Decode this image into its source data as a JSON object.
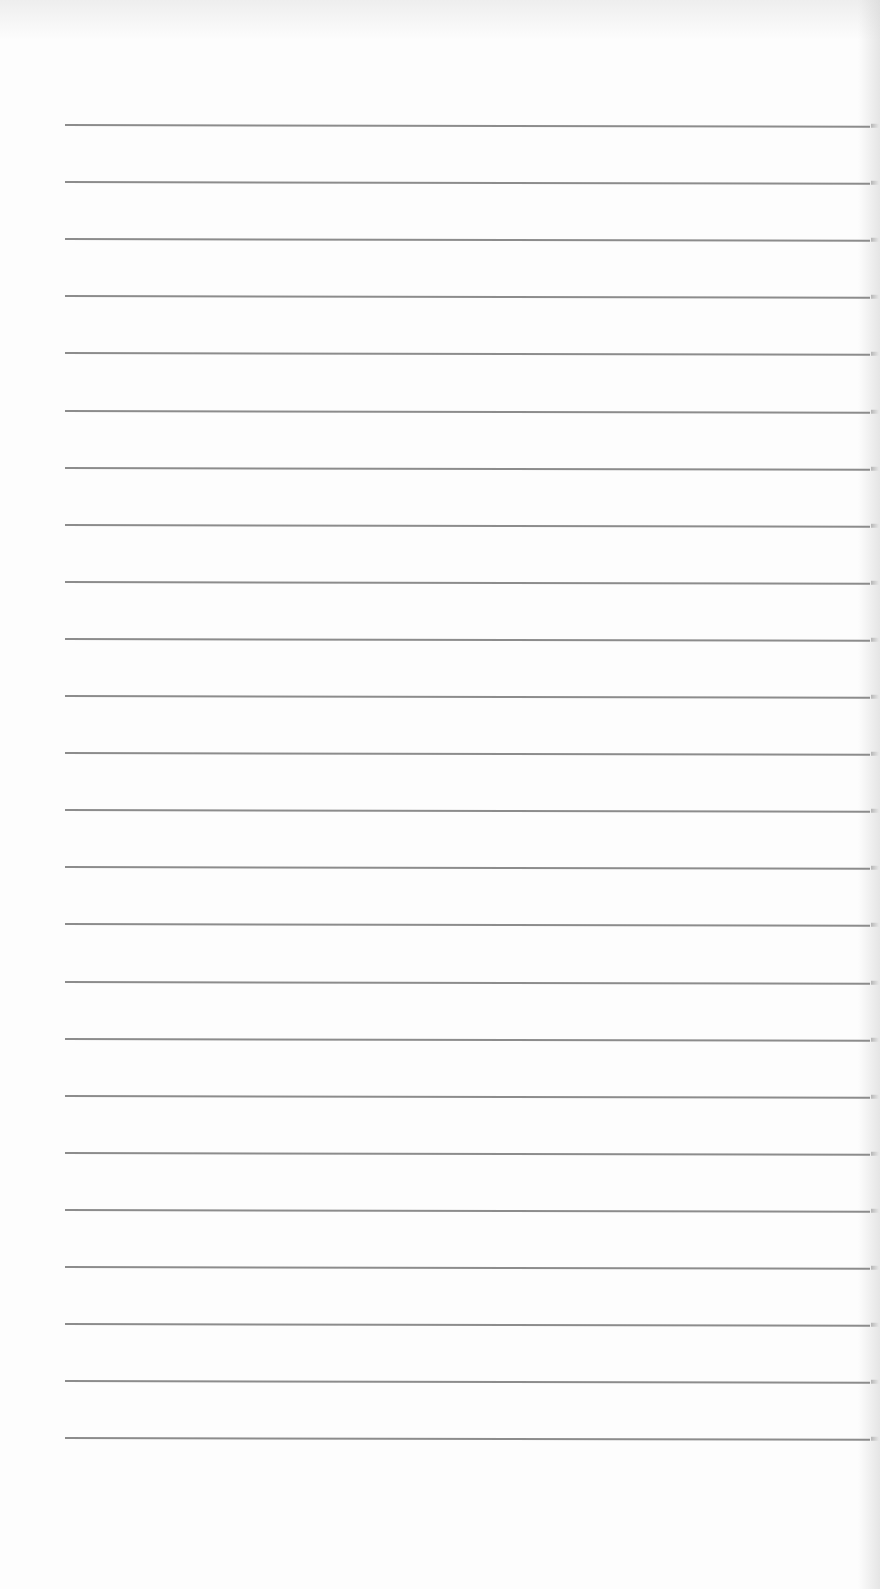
{
  "page": {
    "type": "lined-paper",
    "background_color": "#fdfdfd",
    "rule_color": "#8c8c8c",
    "rule_count": 24,
    "rule_first_y": 124,
    "rule_spacing": 57.1,
    "rule_left_x": 65,
    "text_content": ""
  }
}
